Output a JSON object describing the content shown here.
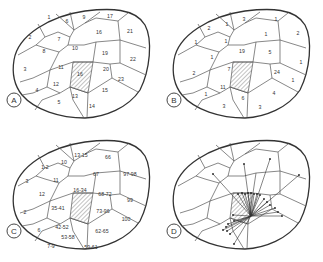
{
  "panels": [
    {
      "id": "A",
      "offset": [
        0,
        0
      ],
      "labels": [
        {
          "t": "1",
          "x": 49,
          "y": 18
        },
        {
          "t": "6",
          "x": 67,
          "y": 22
        },
        {
          "t": "9",
          "x": 84,
          "y": 18
        },
        {
          "t": "17",
          "x": 110,
          "y": 17
        },
        {
          "t": "2",
          "x": 30,
          "y": 38
        },
        {
          "t": "7",
          "x": 59,
          "y": 40
        },
        {
          "t": "16",
          "x": 99,
          "y": 33
        },
        {
          "t": "21",
          "x": 130,
          "y": 32
        },
        {
          "t": "8",
          "x": 44,
          "y": 52
        },
        {
          "t": "10",
          "x": 75,
          "y": 49
        },
        {
          "t": "19",
          "x": 105,
          "y": 54
        },
        {
          "t": "22",
          "x": 133,
          "y": 60
        },
        {
          "t": "3",
          "x": 25,
          "y": 70
        },
        {
          "t": "11",
          "x": 61,
          "y": 68
        },
        {
          "t": "16",
          "x": 80,
          "y": 75
        },
        {
          "t": "20",
          "x": 106,
          "y": 70
        },
        {
          "t": "23",
          "x": 121,
          "y": 80
        },
        {
          "t": "12",
          "x": 56,
          "y": 85
        },
        {
          "t": "4",
          "x": 37,
          "y": 91
        },
        {
          "t": "13",
          "x": 75,
          "y": 97
        },
        {
          "t": "15",
          "x": 105,
          "y": 91
        },
        {
          "t": "5",
          "x": 59,
          "y": 103
        },
        {
          "t": "14",
          "x": 92,
          "y": 107
        }
      ]
    },
    {
      "id": "B",
      "offset": [
        160,
        0
      ],
      "labels": [
        {
          "t": "2",
          "x": 49,
          "y": 29
        },
        {
          "t": "1",
          "x": 67,
          "y": 25
        },
        {
          "t": "3",
          "x": 84,
          "y": 20
        },
        {
          "t": "1",
          "x": 116,
          "y": 20
        },
        {
          "t": "1",
          "x": 36,
          "y": 43
        },
        {
          "t": "1",
          "x": 66,
          "y": 42
        },
        {
          "t": "1",
          "x": 106,
          "y": 35
        },
        {
          "t": "2",
          "x": 138,
          "y": 34
        },
        {
          "t": "1",
          "x": 52,
          "y": 58
        },
        {
          "t": "19",
          "x": 82,
          "y": 52
        },
        {
          "t": "5",
          "x": 110,
          "y": 53
        },
        {
          "t": "1",
          "x": 141,
          "y": 63
        },
        {
          "t": "2",
          "x": 34,
          "y": 74
        },
        {
          "t": "7",
          "x": 69,
          "y": 70
        },
        {
          "t": "24",
          "x": 117,
          "y": 73
        },
        {
          "t": "11",
          "x": 63,
          "y": 88
        },
        {
          "t": "1",
          "x": 133,
          "y": 81
        },
        {
          "t": "1",
          "x": 46,
          "y": 95
        },
        {
          "t": "6",
          "x": 83,
          "y": 99
        },
        {
          "t": "4",
          "x": 114,
          "y": 94
        },
        {
          "t": "3",
          "x": 64,
          "y": 107
        },
        {
          "t": "3",
          "x": 100,
          "y": 108
        }
      ]
    },
    {
      "id": "C",
      "offset": [
        0,
        131
      ],
      "labels": [
        {
          "t": "1-2",
          "x": 45,
          "y": 37
        },
        {
          "t": "10",
          "x": 64,
          "y": 32
        },
        {
          "t": "13-15",
          "x": 81,
          "y": 25
        },
        {
          "t": "66",
          "x": 108,
          "y": 27
        },
        {
          "t": "3",
          "x": 27,
          "y": 51
        },
        {
          "t": "11",
          "x": 56,
          "y": 50
        },
        {
          "t": "67",
          "x": 96,
          "y": 44
        },
        {
          "t": "97-98",
          "x": 130,
          "y": 44
        },
        {
          "t": "12",
          "x": 42,
          "y": 64
        },
        {
          "t": "16-34",
          "x": 80,
          "y": 60
        },
        {
          "t": "68-72",
          "x": 105,
          "y": 64
        },
        {
          "t": "99",
          "x": 130,
          "y": 70
        },
        {
          "t": "2",
          "x": 25,
          "y": 82
        },
        {
          "t": "35-41",
          "x": 58,
          "y": 78
        },
        {
          "t": "73-96",
          "x": 103,
          "y": 81
        },
        {
          "t": "100",
          "x": 126,
          "y": 89
        },
        {
          "t": "6",
          "x": 39,
          "y": 100
        },
        {
          "t": "42-52",
          "x": 62,
          "y": 97
        },
        {
          "t": "62-65",
          "x": 102,
          "y": 101
        },
        {
          "t": "53-58",
          "x": 68,
          "y": 107
        },
        {
          "t": "7-9",
          "x": 51,
          "y": 116
        },
        {
          "t": "59-61",
          "x": 91,
          "y": 117
        }
      ]
    },
    {
      "id": "D",
      "offset": [
        160,
        131
      ],
      "labels": []
    }
  ],
  "rays": {
    "origin": [
      91,
      85
    ],
    "endpoints": [
      [
        53,
        43
      ],
      [
        84,
        33
      ],
      [
        110,
        28
      ],
      [
        139,
        44
      ],
      [
        78,
        63
      ],
      [
        82,
        62
      ],
      [
        85,
        63
      ],
      [
        88,
        62
      ],
      [
        91,
        62
      ],
      [
        94,
        63
      ],
      [
        97,
        63
      ],
      [
        100,
        64
      ],
      [
        104,
        68
      ],
      [
        107,
        71
      ],
      [
        110,
        74
      ],
      [
        115,
        77
      ],
      [
        118,
        81
      ],
      [
        122,
        85
      ],
      [
        73,
        84
      ],
      [
        74,
        90
      ],
      [
        68,
        93
      ],
      [
        66,
        96
      ],
      [
        63,
        99
      ],
      [
        67,
        100
      ],
      [
        70,
        103
      ],
      [
        74,
        113
      ]
    ]
  },
  "colors": {
    "line": "#333333",
    "region_edge": "#555555",
    "hatch": "#666666",
    "background": "#ffffff"
  }
}
